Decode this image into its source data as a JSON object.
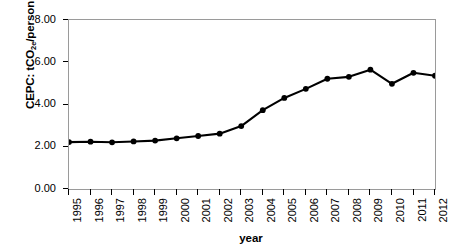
{
  "chart_data": {
    "type": "line",
    "title": "",
    "xlabel": "year",
    "ylabel": "CEPC: tCO2e/person",
    "ylabel_parts": {
      "pre": "CEPC: tCO",
      "sub": "2e",
      "post": "/person"
    },
    "categories": [
      "1995",
      "1996",
      "1997",
      "1998",
      "1999",
      "2000",
      "2001",
      "2002",
      "2003",
      "2004",
      "2005",
      "2006",
      "2007",
      "2008",
      "2009",
      "2010",
      "2011",
      "2012"
    ],
    "values": [
      2.22,
      2.24,
      2.21,
      2.25,
      2.29,
      2.4,
      2.51,
      2.62,
      2.98,
      3.73,
      4.31,
      4.74,
      5.22,
      5.31,
      5.65,
      4.98,
      5.5,
      5.36
    ],
    "series": [
      {
        "name": "CEPC",
        "values": [
          2.22,
          2.24,
          2.21,
          2.25,
          2.29,
          2.4,
          2.51,
          2.62,
          2.98,
          3.73,
          4.31,
          4.74,
          5.22,
          5.31,
          5.65,
          4.98,
          5.5,
          5.36
        ]
      }
    ],
    "ylim": [
      0.0,
      8.0
    ],
    "yticks": [
      0.0,
      2.0,
      4.0,
      6.0,
      8.0
    ],
    "ytick_labels": [
      "0.00",
      "2.00",
      "4.00",
      "6.00",
      "8.00"
    ],
    "grid": false,
    "legend": "none",
    "marker": "filled-circle",
    "line_color": "#000000",
    "marker_color": "#000000",
    "axis_color": "#9a9a9a",
    "background": "#ffffff"
  }
}
